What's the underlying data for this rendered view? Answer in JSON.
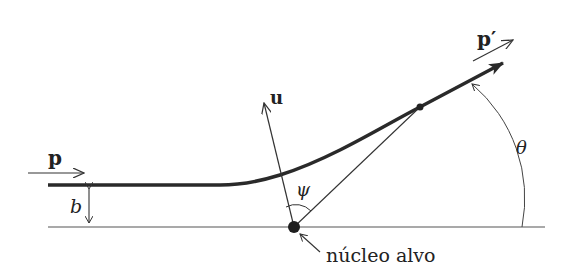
{
  "diagram": {
    "labels": {
      "p": "p",
      "p_prime": "p′",
      "u": "u",
      "b": "b",
      "psi": "ψ",
      "theta": "θ",
      "target": "núcleo alvo"
    },
    "colors": {
      "line": "#333333",
      "trajectory": "#2a2a2a",
      "background": "#ffffff"
    }
  }
}
